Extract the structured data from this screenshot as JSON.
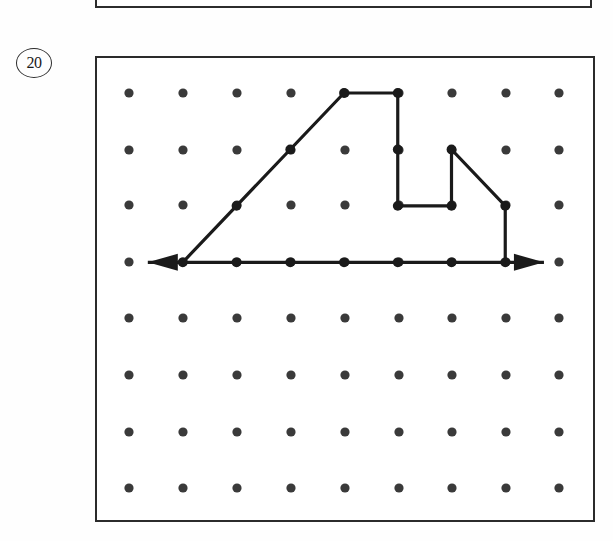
{
  "page": {
    "background_color": "#fefefe",
    "width": 613,
    "height": 541
  },
  "problem": {
    "number_label": "20",
    "badge_shape": "circle"
  },
  "previous_frame": {
    "present": true,
    "description": "bottom portion of the previous problem's box"
  },
  "geoboard": {
    "frame": {
      "x": 95,
      "y": 56,
      "width": 500,
      "height": 466,
      "border_color": "#2b2b2b",
      "border_width": 2
    },
    "grid": {
      "columns": 9,
      "rows": 8,
      "col_x": [
        129,
        183,
        237,
        291,
        345,
        399,
        452,
        506,
        559
      ],
      "row_y": [
        93,
        150,
        205,
        262,
        318,
        375,
        432,
        488
      ],
      "dot_radius": 4.6,
      "dot_color": "#3a3a3a"
    }
  },
  "chart_data": {
    "type": "scatter",
    "title": "",
    "xlabel": "",
    "ylabel": "",
    "grid": true,
    "legend_position": "none",
    "x": [
      0,
      1,
      2,
      3,
      4,
      5,
      6,
      7,
      8
    ],
    "y": [
      0,
      1,
      2,
      3,
      4,
      5,
      6,
      7
    ],
    "annotations": [
      {
        "name": "left-arrow-tip",
        "col": 0.35,
        "row": 3
      },
      {
        "name": "right-arrow-tip",
        "col": 7.72,
        "row": 3
      }
    ],
    "series": [
      {
        "name": "figure-outline",
        "stroke": "#1a1a1a",
        "stroke_width": 3.2,
        "points_grid": [
          [
            1,
            3
          ],
          [
            4,
            0
          ],
          [
            5,
            0
          ],
          [
            5,
            2
          ],
          [
            6,
            2
          ],
          [
            6,
            1
          ],
          [
            7,
            2
          ],
          [
            7,
            3
          ],
          [
            1,
            3
          ]
        ]
      }
    ],
    "vertices_grid": [
      [
        1,
        3
      ],
      [
        2,
        2
      ],
      [
        3,
        1
      ],
      [
        4,
        0
      ],
      [
        5,
        0
      ],
      [
        5,
        1
      ],
      [
        5,
        2
      ],
      [
        6,
        2
      ],
      [
        6,
        1
      ],
      [
        7,
        2
      ],
      [
        7,
        3
      ],
      [
        2,
        3
      ],
      [
        3,
        3
      ],
      [
        4,
        3
      ],
      [
        5,
        3
      ],
      [
        6,
        3
      ]
    ]
  }
}
